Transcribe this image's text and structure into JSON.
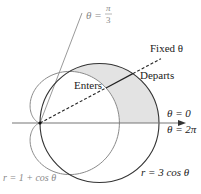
{
  "diagram": {
    "type": "polar-curves",
    "curves": [
      {
        "label": "r = 1 + cos θ",
        "kind": "cardioid",
        "color": "#8a8a8a"
      },
      {
        "label": "r = 3 cos θ",
        "kind": "circle",
        "color": "#333333"
      }
    ],
    "rays": {
      "limit_ray": {
        "theta_label": "θ =",
        "theta_num": "π",
        "theta_den": "3",
        "color": "#999999"
      },
      "fixed_ray": {
        "label": "Fixed θ",
        "style": "dashed"
      }
    },
    "points": {
      "enters": "Enters",
      "departs": "Departs"
    },
    "axis": {
      "label_top": "θ = 0",
      "label_bottom": "θ = 2π"
    },
    "shading": {
      "color": "#e3e3e3",
      "region": "between r = 1 + cos θ and r = 3 cos θ, 0 ≤ θ ≤ π/3"
    }
  }
}
